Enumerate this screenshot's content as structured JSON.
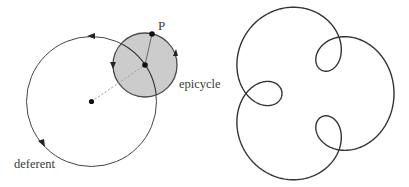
{
  "figure_left": {
    "title": "Deferent and epicycle construction",
    "labels": {
      "point": "P",
      "epicycle": "epicycle",
      "deferent": "deferent"
    },
    "deferent": {
      "cx": 91.5,
      "cy": 101.5,
      "r": 65
    },
    "epicycle": {
      "cx": 145,
      "cy": 65,
      "r": 32,
      "fill": "#c9c9c9",
      "stroke": "#4a4a4a"
    },
    "point_p": {
      "x": 152,
      "y": 34
    },
    "colors": {
      "line": "#444444",
      "dot": "#111111",
      "dashed": "#9a9a9a"
    }
  },
  "figure_right": {
    "title": "Resulting epicyclic path (three-loop epitrochoid)",
    "curve": {
      "cx": 308,
      "cy": 93.5,
      "a": 56,
      "b": 30,
      "freq": 4,
      "sy": 1.05,
      "stroke": "#333333"
    }
  }
}
